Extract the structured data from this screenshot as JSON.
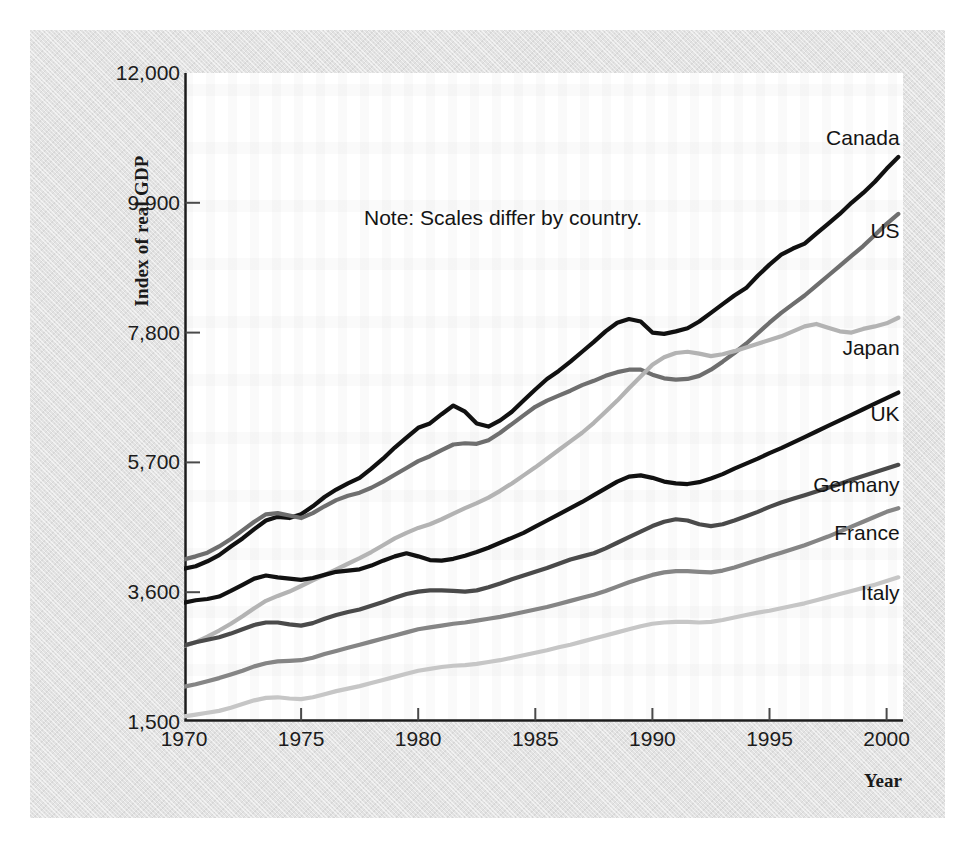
{
  "chart_data": {
    "type": "line",
    "title": "",
    "xlabel": "Year",
    "ylabel": "Index of real GDP",
    "note": "Note: Scales differ by country.",
    "grid": false,
    "legend_position": "right-inline-labels",
    "xlim": [
      1970,
      2000.7
    ],
    "ylim": [
      1500,
      12000
    ],
    "xticks": [
      "1970",
      "1975",
      "1980",
      "1985",
      "1990",
      "1995",
      "2000"
    ],
    "xtick_values": [
      1970,
      1975,
      1980,
      1985,
      1990,
      1995,
      2000
    ],
    "yticks": [
      "1,500",
      "3,600",
      "5,700",
      "7,800",
      "9,900",
      "12,000"
    ],
    "ytick_values": [
      1500,
      3600,
      5700,
      7800,
      9900,
      12000
    ],
    "x": [
      1970,
      1970.5,
      1971,
      1971.5,
      1972,
      1972.5,
      1973,
      1973.5,
      1974,
      1974.5,
      1975,
      1975.5,
      1976,
      1976.5,
      1977,
      1977.5,
      1978,
      1978.5,
      1979,
      1979.5,
      1980,
      1980.5,
      1981,
      1981.5,
      1982,
      1982.5,
      1983,
      1983.5,
      1984,
      1984.5,
      1985,
      1985.5,
      1986,
      1986.5,
      1987,
      1987.5,
      1988,
      1988.5,
      1989,
      1989.5,
      1990,
      1990.5,
      1991,
      1991.5,
      1992,
      1992.5,
      1993,
      1993.5,
      1994,
      1994.5,
      1995,
      1995.5,
      1996,
      1996.5,
      1997,
      1997.5,
      1998,
      1998.5,
      1999,
      1999.5,
      2000,
      2000.5
    ],
    "series": [
      {
        "name": "Canada",
        "color": "#111111",
        "width": 4.2,
        "label_x": 2000.3,
        "label_y": 10950,
        "values": [
          3980,
          4020,
          4100,
          4200,
          4340,
          4470,
          4620,
          4760,
          4820,
          4800,
          4860,
          4990,
          5140,
          5260,
          5360,
          5450,
          5600,
          5760,
          5940,
          6100,
          6260,
          6330,
          6480,
          6620,
          6520,
          6330,
          6280,
          6380,
          6520,
          6700,
          6880,
          7050,
          7180,
          7330,
          7490,
          7650,
          7820,
          7960,
          8020,
          7980,
          7800,
          7780,
          7820,
          7870,
          7980,
          8120,
          8260,
          8400,
          8520,
          8720,
          8900,
          9060,
          9160,
          9240,
          9400,
          9560,
          9720,
          9900,
          10060,
          10240,
          10450,
          10640
        ]
      },
      {
        "name": "US",
        "color": "#6e6e6e",
        "width": 4.2,
        "label_x": 2000.3,
        "label_y": 9450,
        "values": [
          4130,
          4180,
          4240,
          4340,
          4460,
          4600,
          4740,
          4860,
          4880,
          4840,
          4800,
          4880,
          4990,
          5090,
          5160,
          5210,
          5290,
          5390,
          5500,
          5610,
          5720,
          5800,
          5900,
          5990,
          6010,
          6000,
          6060,
          6180,
          6320,
          6460,
          6600,
          6700,
          6780,
          6860,
          6950,
          7020,
          7100,
          7160,
          7200,
          7200,
          7120,
          7060,
          7040,
          7050,
          7100,
          7200,
          7330,
          7470,
          7620,
          7790,
          7960,
          8120,
          8260,
          8400,
          8560,
          8720,
          8880,
          9040,
          9200,
          9380,
          9560,
          9720
        ]
      },
      {
        "name": "Japan",
        "color": "#b3b3b3",
        "width": 4.2,
        "label_x": 2000.3,
        "label_y": 7550,
        "values": [
          2730,
          2790,
          2880,
          2980,
          3090,
          3210,
          3340,
          3460,
          3540,
          3610,
          3700,
          3790,
          3880,
          3970,
          4060,
          4150,
          4250,
          4360,
          4470,
          4560,
          4640,
          4700,
          4780,
          4870,
          4960,
          5040,
          5130,
          5240,
          5360,
          5490,
          5620,
          5760,
          5900,
          6040,
          6180,
          6340,
          6520,
          6700,
          6900,
          7090,
          7280,
          7400,
          7470,
          7490,
          7460,
          7420,
          7450,
          7500,
          7560,
          7620,
          7680,
          7740,
          7820,
          7900,
          7940,
          7880,
          7820,
          7800,
          7860,
          7900,
          7950,
          8040
        ]
      },
      {
        "name": "UK",
        "color": "#111111",
        "width": 4.2,
        "label_x": 2000.3,
        "label_y": 6480,
        "values": [
          3430,
          3470,
          3490,
          3530,
          3620,
          3720,
          3820,
          3870,
          3840,
          3820,
          3800,
          3830,
          3880,
          3930,
          3950,
          3970,
          4030,
          4110,
          4180,
          4230,
          4180,
          4120,
          4110,
          4140,
          4190,
          4250,
          4320,
          4400,
          4480,
          4560,
          4660,
          4760,
          4860,
          4960,
          5060,
          5170,
          5280,
          5390,
          5470,
          5490,
          5450,
          5390,
          5360,
          5350,
          5380,
          5440,
          5510,
          5600,
          5680,
          5760,
          5850,
          5930,
          6020,
          6110,
          6200,
          6290,
          6380,
          6470,
          6560,
          6650,
          6740,
          6830
        ]
      },
      {
        "name": "Germany",
        "color": "#4a4a4a",
        "width": 4.2,
        "label_x": 2000.3,
        "label_y": 5330,
        "values": [
          2740,
          2790,
          2830,
          2870,
          2930,
          3000,
          3070,
          3110,
          3110,
          3080,
          3060,
          3100,
          3170,
          3230,
          3280,
          3320,
          3380,
          3440,
          3510,
          3570,
          3610,
          3630,
          3630,
          3620,
          3610,
          3630,
          3680,
          3740,
          3810,
          3870,
          3930,
          3990,
          4060,
          4130,
          4180,
          4230,
          4310,
          4400,
          4490,
          4580,
          4670,
          4740,
          4780,
          4760,
          4700,
          4670,
          4700,
          4760,
          4830,
          4900,
          4980,
          5050,
          5110,
          5170,
          5230,
          5290,
          5350,
          5420,
          5480,
          5540,
          5600,
          5660
        ]
      },
      {
        "name": "France",
        "color": "#858585",
        "width": 4.2,
        "label_x": 2000.3,
        "label_y": 4550,
        "values": [
          2070,
          2110,
          2160,
          2210,
          2270,
          2330,
          2400,
          2450,
          2480,
          2490,
          2500,
          2540,
          2600,
          2650,
          2700,
          2750,
          2800,
          2850,
          2900,
          2950,
          3000,
          3030,
          3060,
          3090,
          3110,
          3140,
          3170,
          3200,
          3240,
          3280,
          3320,
          3360,
          3410,
          3460,
          3510,
          3560,
          3620,
          3690,
          3760,
          3820,
          3880,
          3920,
          3940,
          3940,
          3930,
          3920,
          3950,
          4000,
          4060,
          4120,
          4180,
          4240,
          4300,
          4360,
          4430,
          4500,
          4580,
          4660,
          4740,
          4820,
          4900,
          4960
        ]
      },
      {
        "name": "Italy",
        "color": "#c6c6c6",
        "width": 4.2,
        "label_x": 2000.3,
        "label_y": 3580,
        "values": [
          1590,
          1620,
          1650,
          1680,
          1730,
          1790,
          1850,
          1890,
          1900,
          1880,
          1870,
          1900,
          1950,
          2000,
          2040,
          2080,
          2130,
          2180,
          2230,
          2280,
          2330,
          2360,
          2390,
          2410,
          2420,
          2440,
          2470,
          2500,
          2540,
          2580,
          2620,
          2660,
          2710,
          2750,
          2800,
          2850,
          2900,
          2950,
          3000,
          3050,
          3090,
          3110,
          3120,
          3120,
          3110,
          3120,
          3150,
          3190,
          3230,
          3270,
          3300,
          3340,
          3380,
          3420,
          3470,
          3520,
          3570,
          3620,
          3670,
          3720,
          3780,
          3840
        ]
      }
    ]
  },
  "axis": {
    "ylabel": "Index of real GDP",
    "xlabel": "Year"
  }
}
